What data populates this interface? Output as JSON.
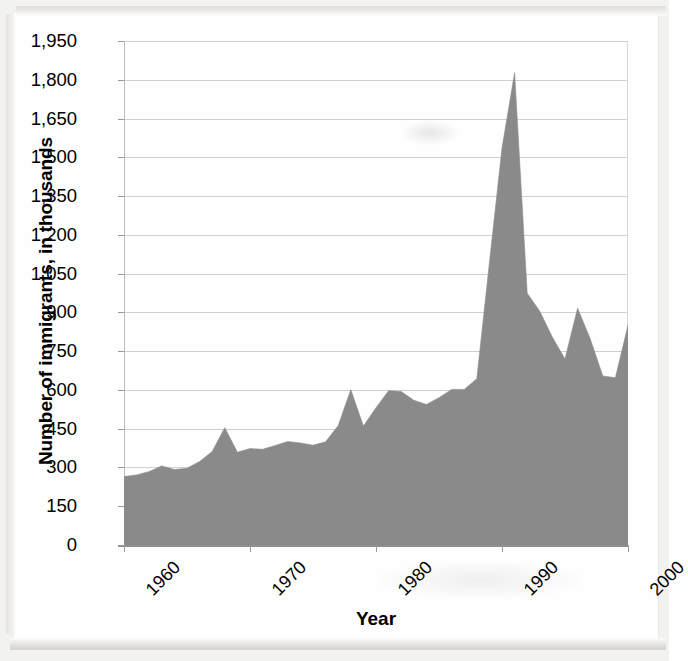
{
  "chart_data": {
    "type": "area",
    "title": "",
    "xlabel": "Year",
    "ylabel": "Number of immigrants, in thousands",
    "xlim": [
      1960,
      2000
    ],
    "ylim": [
      0,
      1950
    ],
    "grid": true,
    "legend": "none",
    "series_name": "Number of immigrants, in thousands",
    "fill_color": "#8a8a8a",
    "x_tick_labels": [
      "1960",
      "1970",
      "1980",
      "1990",
      "2000"
    ],
    "x_ticks": [
      1960,
      1970,
      1980,
      1990,
      2000
    ],
    "y_tick_labels": [
      "0",
      "150",
      "300",
      "450",
      "600",
      "750",
      "900",
      "1,050",
      "1,200",
      "1,350",
      "1,500",
      "1,650",
      "1,800",
      "1,950"
    ],
    "y_ticks": [
      0,
      150,
      300,
      450,
      600,
      750,
      900,
      1050,
      1200,
      1350,
      1500,
      1650,
      1800,
      1950
    ],
    "x": [
      1960,
      1961,
      1962,
      1963,
      1964,
      1965,
      1966,
      1967,
      1968,
      1969,
      1970,
      1971,
      1972,
      1973,
      1974,
      1975,
      1976,
      1977,
      1978,
      1979,
      1980,
      1981,
      1982,
      1983,
      1984,
      1985,
      1986,
      1987,
      1988,
      1989,
      1990,
      1991,
      1992,
      1993,
      1994,
      1995,
      1996,
      1997,
      1998,
      1999,
      2000
    ],
    "values": [
      265,
      271,
      284,
      306,
      292,
      297,
      323,
      362,
      454,
      359,
      373,
      370,
      385,
      400,
      395,
      386,
      399,
      462,
      601,
      460,
      531,
      597,
      594,
      560,
      544,
      570,
      602,
      602,
      643,
      1091,
      1536,
      1827,
      974,
      904,
      804,
      720,
      916,
      798,
      654,
      647,
      850
    ],
    "peak_annotation": {
      "year": 1991,
      "value": 1827
    }
  },
  "axis": {
    "y_title": "Number of immigrants, in thousands",
    "x_title": "Year"
  }
}
